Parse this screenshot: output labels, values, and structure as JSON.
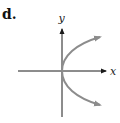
{
  "figure": {
    "part_label": "d.",
    "x_axis_label": "x",
    "y_axis_label": "y",
    "curve_description": "parabola opening to the right with vertex at origin",
    "colors": {
      "axes": "#1a1a1a",
      "curve": "#8c8c8c",
      "background": "#ffffff"
    }
  }
}
